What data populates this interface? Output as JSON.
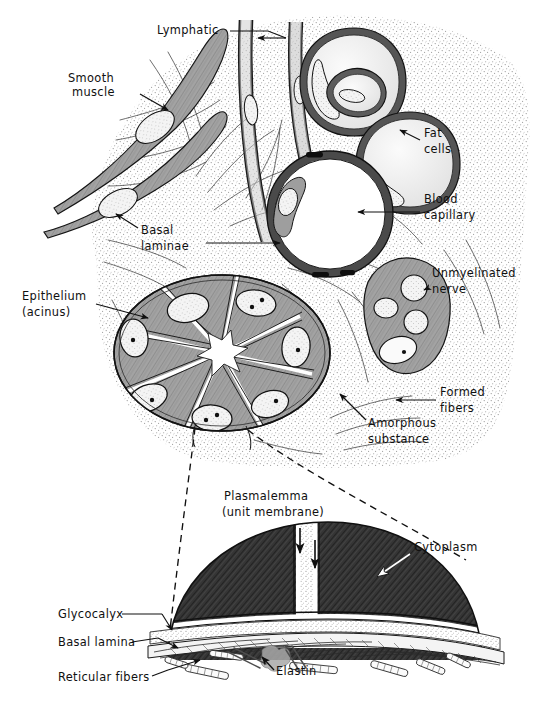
{
  "figure": {
    "panels": [
      {
        "id": "upper",
        "name": "Loose connective tissue surrounding a glandular acinus"
      },
      {
        "id": "lower",
        "name": "Enlarged detail of epithelial cell base and underlying basal lamina"
      }
    ]
  },
  "labels": {
    "lymphatic": "Lymphatic",
    "smooth_muscle_line1": "Smooth",
    "smooth_muscle_line2": "muscle",
    "fat_cells_line1": "Fat",
    "fat_cells_line2": "cells",
    "basal_laminae_line1": "Basal",
    "basal_laminae_line2": "laminae",
    "blood_capillary_line1": "Blood",
    "blood_capillary_line2": "capillary",
    "epithelium_line1": "Epithelium",
    "epithelium_line2": "(acinus)",
    "unmyelinated_nerve_line1": "Unmyelinated",
    "unmyelinated_nerve_line2": "nerve",
    "formed_fibers_line1": "Formed",
    "formed_fibers_line2": "fibers",
    "amorphous_substance_line1": "Amorphous",
    "amorphous_substance_line2": "substance",
    "plasmalemma_line1": "Plasmalemma",
    "plasmalemma_line2": "(unit  membrane)",
    "cytoplasm": "Cytoplasm",
    "glycocalyx": "Glycocalyx",
    "basal_lamina": "Basal  lamina",
    "reticular_fibers": "Reticular  fibers",
    "elastin": "Elastin"
  },
  "colors": {
    "ink": "#101010",
    "line": "#1a1a1a",
    "stipple": "#8c8c8c",
    "cell_fill": "#9a9a9a",
    "cell_fill_dark": "#7d7d7d",
    "nucleus_fill": "#f2f2f2",
    "lumen_white": "#ffffff",
    "fat_fill": "#ededed",
    "cytoplasm_dark": "#2e2e2e",
    "glyco_fill": "#e8e8e8",
    "background": "#ffffff"
  }
}
